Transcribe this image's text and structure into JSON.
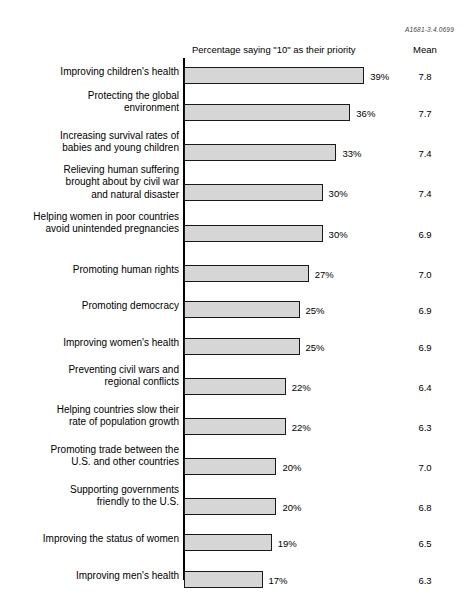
{
  "reference_code": "A1681-3.4.0699",
  "headers": {
    "percentage": "Percentage saying \"10\" as their priority",
    "mean": "Mean"
  },
  "chart_data": {
    "type": "bar",
    "title": "",
    "subtitle": "",
    "xlabel": "Percentage saying \"10\" as their priority",
    "ylabel": "",
    "orientation": "horizontal",
    "grid": false,
    "legend": null,
    "xlim": [
      0,
      40
    ],
    "value_suffix": "%",
    "extra_column": {
      "name": "Mean",
      "values": [
        7.8,
        7.7,
        7.4,
        7.4,
        6.9,
        7.0,
        6.9,
        6.9,
        6.4,
        6.3,
        7.0,
        6.8,
        6.5,
        6.3,
        6.3
      ],
      "labels": [
        "7.8",
        "7.7",
        "7.4",
        "7.4",
        "6.9",
        "7.0",
        "6.9",
        "6.9",
        "6.4",
        "6.3",
        "7.0",
        "6.8",
        "6.5",
        "6.3",
        "6.3"
      ]
    },
    "categories": [
      "Improving children's health",
      "Protecting the global\nenvironment",
      "Increasing survival rates of\nbabies and young children",
      "Relieving human suffering\nbrought about by civil war\nand natural disaster",
      "Helping women in poor countries\navoid unintended pregnancies",
      "Promoting human rights",
      "Promoting democracy",
      "Improving women's health",
      "Preventing civil wars and\nregional conflicts",
      "Helping countries slow their\nrate of population growth",
      "Promoting trade between the\nU.S. and other countries",
      "Supporting governments\nfriendly to the U.S.",
      "Improving the status of women",
      "Improving men's health",
      "Improving economic conditions\nin developing countries"
    ],
    "values": [
      39,
      36,
      33,
      30,
      30,
      27,
      25,
      25,
      22,
      22,
      20,
      20,
      19,
      17,
      15
    ],
    "value_labels": [
      "39%",
      "36%",
      "33%",
      "30%",
      "30%",
      "27%",
      "25%",
      "25%",
      "22%",
      "22%",
      "20%",
      "20%",
      "19%",
      "17%",
      "15%"
    ]
  },
  "rows": [
    {
      "label": "Improving children's health",
      "value": 39,
      "value_label": "39%",
      "mean": "7.8",
      "bar_top": 9,
      "label_top": 8
    },
    {
      "label": "Protecting the global\nenvironment",
      "value": 36,
      "value_label": "36%",
      "mean": "7.7",
      "bar_top": 46,
      "label_top": 32
    },
    {
      "label": "Increasing survival rates of\nbabies and young children",
      "value": 33,
      "value_label": "33%",
      "mean": "7.4",
      "bar_top": 86,
      "label_top": 72
    },
    {
      "label": "Relieving human suffering\nbrought about by civil war\nand natural disaster",
      "value": 30,
      "value_label": "30%",
      "mean": "7.4",
      "bar_top": 126,
      "label_top": 106
    },
    {
      "label": "Helping women in poor countries\navoid unintended pregnancies",
      "value": 30,
      "value_label": "30%",
      "mean": "6.9",
      "bar_top": 167,
      "label_top": 153
    },
    {
      "label": "Promoting human rights",
      "value": 27,
      "value_label": "27%",
      "mean": "7.0",
      "bar_top": 207,
      "label_top": 206
    },
    {
      "label": "Promoting democracy",
      "value": 25,
      "value_label": "25%",
      "mean": "6.9",
      "bar_top": 243,
      "label_top": 242
    },
    {
      "label": "Improving women's health",
      "value": 25,
      "value_label": "25%",
      "mean": "6.9",
      "bar_top": 280,
      "label_top": 279
    },
    {
      "label": "Preventing civil wars and\nregional conflicts",
      "value": 22,
      "value_label": "22%",
      "mean": "6.4",
      "bar_top": 320,
      "label_top": 306
    },
    {
      "label": "Helping countries slow their\nrate of population growth",
      "value": 22,
      "value_label": "22%",
      "mean": "6.3",
      "bar_top": 360,
      "label_top": 346
    },
    {
      "label": "Promoting trade between the\nU.S. and other countries",
      "value": 20,
      "value_label": "20%",
      "mean": "7.0",
      "bar_top": 400,
      "label_top": 386
    },
    {
      "label": "Supporting governments\nfriendly to the U.S.",
      "value": 20,
      "value_label": "20%",
      "mean": "6.8",
      "bar_top": 440,
      "label_top": 426
    },
    {
      "label": "Improving the status of women",
      "value": 19,
      "value_label": "19%",
      "mean": "6.5",
      "bar_top": 476,
      "label_top": 475
    },
    {
      "label": "Improving men's health",
      "value": 17,
      "value_label": "17%",
      "mean": "6.3",
      "bar_top": 513,
      "label_top": 512
    },
    {
      "label": "Improving economic conditions\nin developing countries",
      "value": 15,
      "value_label": "15%",
      "mean": "6.3",
      "bar_top": 550,
      "label_top": 536
    }
  ]
}
